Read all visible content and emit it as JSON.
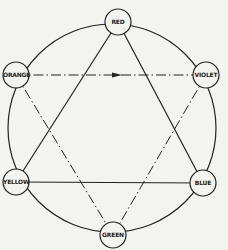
{
  "diagram": {
    "type": "color-wheel",
    "nodes": [
      {
        "id": "red",
        "label": "RED",
        "x": 118,
        "y": 22
      },
      {
        "id": "orange",
        "label": "ORANGE",
        "x": 16,
        "y": 75
      },
      {
        "id": "violet",
        "label": "VIOLET",
        "x": 206,
        "y": 75
      },
      {
        "id": "yellow",
        "label": "YELLOW",
        "x": 16,
        "y": 182
      },
      {
        "id": "blue",
        "label": "BLUE",
        "x": 203,
        "y": 183
      },
      {
        "id": "green",
        "label": "GREEN",
        "x": 113,
        "y": 235
      }
    ],
    "solid_triangle": [
      "RED",
      "YELLOW",
      "BLUE"
    ],
    "dashdot_triangle": [
      "ORANGE",
      "VIOLET",
      "GREEN"
    ],
    "arrow": {
      "from": "ORANGE",
      "to": "VIOLET"
    }
  }
}
